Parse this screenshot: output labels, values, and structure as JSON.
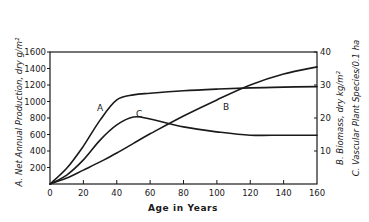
{
  "chart_data": {
    "type": "line",
    "title": "",
    "xlabel": "Age in Years",
    "ylabel_left": "A. Net Annual Production, dry g/m²",
    "ylabel_right": [
      "B. Biomass, dry kg/m²",
      "C. Vascular Plant Species/0.1 ha"
    ],
    "xlim": [
      0,
      160
    ],
    "ylim_left": [
      0,
      1600
    ],
    "ylim_right": [
      0,
      40
    ],
    "x_ticks": [
      0,
      20,
      40,
      60,
      80,
      100,
      120,
      140,
      160
    ],
    "y_left_ticks": [
      200,
      400,
      600,
      800,
      1000,
      1200,
      1400,
      1600
    ],
    "y_right_ticks": [
      10,
      20,
      30,
      40
    ],
    "grid": false,
    "legend": "inline curve labels",
    "x": [
      0,
      10,
      20,
      30,
      40,
      50,
      60,
      80,
      100,
      120,
      140,
      160
    ],
    "series": [
      {
        "name": "A",
        "axis": "left",
        "description": "Net Annual Production, dry g/m²",
        "values": [
          0,
          190,
          460,
          775,
          1020,
          1080,
          1100,
          1130,
          1150,
          1165,
          1175,
          1180
        ]
      },
      {
        "name": "B",
        "axis": "right",
        "description": "Biomass, dry kg/m²",
        "values": [
          0,
          1.8,
          4.2,
          6.7,
          9.4,
          12.3,
          15.2,
          20.6,
          25.5,
          30.0,
          33.3,
          35.5
        ]
      },
      {
        "name": "C",
        "axis": "right",
        "description": "Vascular Plant Species/0.1 ha",
        "values": [
          0,
          2.7,
          7.3,
          13.3,
          17.9,
          20.3,
          19.7,
          17.3,
          15.8,
          14.8,
          14.8,
          14.8
        ]
      }
    ],
    "annotations": [
      {
        "text": "A",
        "x": 30,
        "y_left": 920
      },
      {
        "text": "C",
        "x": 54,
        "y_right": 21.5
      },
      {
        "text": "B",
        "x": 106,
        "y_right": 23
      }
    ]
  },
  "labels": {
    "x_axis_title": "Age in Years",
    "left_axis_title": "A. Net Annual Production, dry g/m²",
    "right_axis_title_b": "B. Biomass, dry kg/m²",
    "right_axis_title_c": "C. Vascular Plant Species/0.1 ha",
    "curve_a": "A",
    "curve_b": "B",
    "curve_c": "C"
  },
  "ticks": {
    "x": [
      "0",
      "20",
      "40",
      "60",
      "80",
      "100",
      "120",
      "140",
      "160"
    ],
    "y_left": [
      "200",
      "400",
      "600",
      "800",
      "1000",
      "1200",
      "1400",
      "1600"
    ],
    "y_right": [
      "10",
      "20",
      "30",
      "40"
    ]
  }
}
